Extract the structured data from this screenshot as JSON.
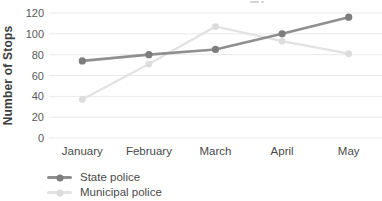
{
  "chart_data": {
    "type": "line",
    "categories": [
      "January",
      "February",
      "March",
      "April",
      "May"
    ],
    "series": [
      {
        "name": "State police",
        "values": [
          74,
          80,
          85,
          100,
          116
        ],
        "color": "#8f8f8f",
        "marker_color": "#7d7d7d"
      },
      {
        "name": "Municipal police",
        "values": [
          37,
          71,
          107,
          93,
          81
        ],
        "color": "#e2e2e2",
        "marker_color": "#dcdcdc"
      }
    ],
    "ylabel": "Number of Stops",
    "xlabel": "",
    "ylim": [
      0,
      120
    ],
    "y_ticks": [
      0,
      20,
      40,
      60,
      80,
      100,
      120
    ],
    "grid": "horizontal",
    "gridline_color": "#e9e9e9",
    "legend_position": "bottom-left",
    "tick_label_color": "#595959",
    "axis_label_color": "#3d3d3d",
    "background": "#ffffff"
  }
}
